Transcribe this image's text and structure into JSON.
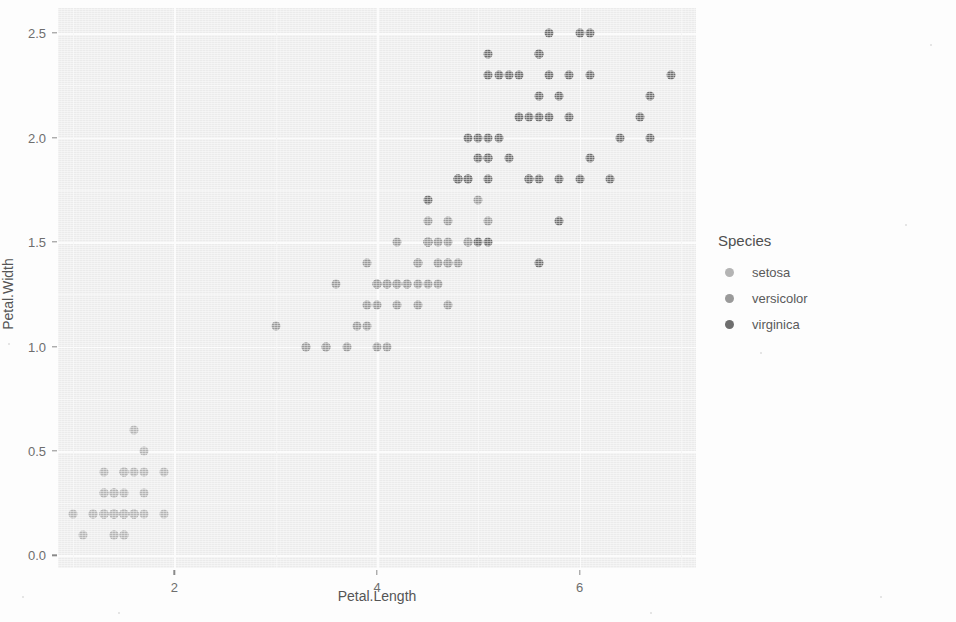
{
  "chart_data": {
    "type": "scatter",
    "title": "",
    "xlabel": "Petal.Length",
    "ylabel": "Petal.Width",
    "xlim": [
      0.85,
      7.15
    ],
    "ylim": [
      -0.06,
      2.62
    ],
    "xticks": [
      2,
      4,
      6
    ],
    "xtick_labels": [
      "2",
      "4",
      "6"
    ],
    "yticks": [
      0.0,
      0.5,
      1.0,
      1.5,
      2.0,
      2.5
    ],
    "ytick_labels": [
      "0.0",
      "0.5",
      "1.0",
      "1.5",
      "2.0",
      "2.5"
    ],
    "grid": true,
    "legend": {
      "title": "Species",
      "position": "right",
      "entries": [
        {
          "name": "setosa",
          "color": "#b4b4b4"
        },
        {
          "name": "versicolor",
          "color": "#9a9a9a"
        },
        {
          "name": "virginica",
          "color": "#6e6e6e"
        }
      ]
    },
    "series": [
      {
        "name": "setosa",
        "color": "#b4b4b4",
        "points": [
          [
            1.4,
            0.2
          ],
          [
            1.4,
            0.2
          ],
          [
            1.3,
            0.2
          ],
          [
            1.5,
            0.2
          ],
          [
            1.4,
            0.2
          ],
          [
            1.7,
            0.4
          ],
          [
            1.4,
            0.3
          ],
          [
            1.5,
            0.2
          ],
          [
            1.4,
            0.2
          ],
          [
            1.5,
            0.1
          ],
          [
            1.5,
            0.2
          ],
          [
            1.6,
            0.2
          ],
          [
            1.4,
            0.1
          ],
          [
            1.1,
            0.1
          ],
          [
            1.2,
            0.2
          ],
          [
            1.5,
            0.4
          ],
          [
            1.3,
            0.4
          ],
          [
            1.4,
            0.3
          ],
          [
            1.7,
            0.3
          ],
          [
            1.5,
            0.3
          ],
          [
            1.7,
            0.2
          ],
          [
            1.5,
            0.4
          ],
          [
            1.0,
            0.2
          ],
          [
            1.7,
            0.5
          ],
          [
            1.9,
            0.2
          ],
          [
            1.6,
            0.2
          ],
          [
            1.6,
            0.4
          ],
          [
            1.5,
            0.2
          ],
          [
            1.4,
            0.2
          ],
          [
            1.6,
            0.2
          ],
          [
            1.6,
            0.2
          ],
          [
            1.5,
            0.4
          ],
          [
            1.5,
            0.1
          ],
          [
            1.4,
            0.2
          ],
          [
            1.5,
            0.2
          ],
          [
            1.2,
            0.2
          ],
          [
            1.3,
            0.2
          ],
          [
            1.4,
            0.1
          ],
          [
            1.3,
            0.2
          ],
          [
            1.5,
            0.2
          ],
          [
            1.3,
            0.3
          ],
          [
            1.3,
            0.3
          ],
          [
            1.3,
            0.2
          ],
          [
            1.6,
            0.6
          ],
          [
            1.9,
            0.4
          ],
          [
            1.4,
            0.3
          ],
          [
            1.6,
            0.2
          ],
          [
            1.4,
            0.2
          ],
          [
            1.5,
            0.2
          ],
          [
            1.4,
            0.2
          ]
        ]
      },
      {
        "name": "versicolor",
        "color": "#9a9a9a",
        "points": [
          [
            4.7,
            1.4
          ],
          [
            4.5,
            1.5
          ],
          [
            4.9,
            1.5
          ],
          [
            4.0,
            1.3
          ],
          [
            4.6,
            1.5
          ],
          [
            4.5,
            1.3
          ],
          [
            4.7,
            1.6
          ],
          [
            3.3,
            1.0
          ],
          [
            4.6,
            1.3
          ],
          [
            3.9,
            1.4
          ],
          [
            3.5,
            1.0
          ],
          [
            4.2,
            1.5
          ],
          [
            4.0,
            1.0
          ],
          [
            4.7,
            1.4
          ],
          [
            3.6,
            1.3
          ],
          [
            4.4,
            1.4
          ],
          [
            4.5,
            1.5
          ],
          [
            4.1,
            1.0
          ],
          [
            4.5,
            1.5
          ],
          [
            3.9,
            1.1
          ],
          [
            4.8,
            1.8
          ],
          [
            4.0,
            1.3
          ],
          [
            4.9,
            1.5
          ],
          [
            4.7,
            1.2
          ],
          [
            4.3,
            1.3
          ],
          [
            4.4,
            1.4
          ],
          [
            4.8,
            1.4
          ],
          [
            5.0,
            1.7
          ],
          [
            4.5,
            1.5
          ],
          [
            3.5,
            1.0
          ],
          [
            3.8,
            1.1
          ],
          [
            3.7,
            1.0
          ],
          [
            3.9,
            1.2
          ],
          [
            5.1,
            1.6
          ],
          [
            4.5,
            1.5
          ],
          [
            4.5,
            1.6
          ],
          [
            4.7,
            1.5
          ],
          [
            4.4,
            1.3
          ],
          [
            4.1,
            1.3
          ],
          [
            4.0,
            1.3
          ],
          [
            4.4,
            1.2
          ],
          [
            4.6,
            1.4
          ],
          [
            4.0,
            1.2
          ],
          [
            3.3,
            1.0
          ],
          [
            4.2,
            1.3
          ],
          [
            4.2,
            1.2
          ],
          [
            4.2,
            1.3
          ],
          [
            4.3,
            1.3
          ],
          [
            3.0,
            1.1
          ],
          [
            4.1,
            1.3
          ]
        ]
      },
      {
        "name": "virginica",
        "color": "#6e6e6e",
        "points": [
          [
            6.0,
            2.5
          ],
          [
            5.1,
            1.9
          ],
          [
            5.9,
            2.1
          ],
          [
            5.6,
            1.8
          ],
          [
            5.8,
            2.2
          ],
          [
            6.6,
            2.1
          ],
          [
            4.5,
            1.7
          ],
          [
            6.3,
            1.8
          ],
          [
            5.8,
            1.8
          ],
          [
            6.1,
            2.5
          ],
          [
            5.1,
            2.0
          ],
          [
            5.3,
            1.9
          ],
          [
            5.5,
            2.1
          ],
          [
            5.0,
            2.0
          ],
          [
            5.1,
            2.4
          ],
          [
            5.3,
            2.3
          ],
          [
            5.5,
            1.8
          ],
          [
            6.7,
            2.2
          ],
          [
            6.9,
            2.3
          ],
          [
            5.0,
            1.5
          ],
          [
            5.7,
            2.3
          ],
          [
            4.9,
            2.0
          ],
          [
            6.7,
            2.0
          ],
          [
            4.9,
            1.8
          ],
          [
            5.7,
            2.1
          ],
          [
            6.0,
            1.8
          ],
          [
            4.8,
            1.8
          ],
          [
            4.9,
            1.8
          ],
          [
            5.6,
            2.1
          ],
          [
            5.8,
            1.6
          ],
          [
            6.1,
            1.9
          ],
          [
            6.4,
            2.0
          ],
          [
            5.6,
            2.2
          ],
          [
            5.1,
            1.5
          ],
          [
            5.6,
            1.4
          ],
          [
            6.1,
            2.3
          ],
          [
            5.6,
            2.4
          ],
          [
            5.5,
            1.8
          ],
          [
            4.8,
            1.8
          ],
          [
            5.4,
            2.1
          ],
          [
            5.6,
            2.4
          ],
          [
            5.1,
            2.3
          ],
          [
            5.1,
            1.9
          ],
          [
            5.9,
            2.3
          ],
          [
            5.7,
            2.5
          ],
          [
            5.2,
            2.3
          ],
          [
            5.0,
            1.9
          ],
          [
            5.2,
            2.0
          ],
          [
            5.4,
            2.3
          ],
          [
            5.1,
            1.8
          ]
        ]
      }
    ]
  }
}
